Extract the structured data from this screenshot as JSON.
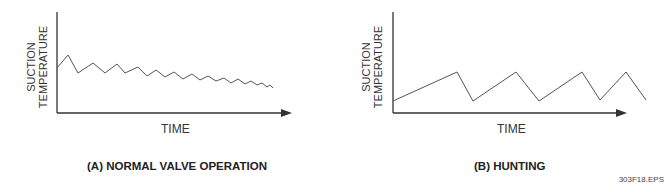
{
  "figure_id": "303F18.EPS",
  "panels": [
    {
      "caption": "(A) NORMAL VALVE OPERATION",
      "ylabel_line1": "SUCTION",
      "ylabel_line2": "TEMPERATURE",
      "xlabel": "TIME",
      "curve_color": "#555555",
      "axis_color": "#333333"
    },
    {
      "caption": "(B) HUNTING",
      "ylabel_line1": "SUCTION",
      "ylabel_line2": "TEMPERATURE",
      "xlabel": "TIME",
      "curve_color": "#555555",
      "axis_color": "#333333"
    }
  ],
  "chart_data": [
    {
      "type": "line",
      "title": "(A) NORMAL VALVE OPERATION",
      "xlabel": "TIME",
      "ylabel": "SUCTION TEMPERATURE",
      "description": "Damped oscillation: suction temperature oscillates with decreasing amplitude and gradually decreasing mean over time",
      "points_px": [
        [
          57,
          68
        ],
        [
          68,
          55
        ],
        [
          78,
          73
        ],
        [
          93,
          63
        ],
        [
          105,
          73
        ],
        [
          117,
          64
        ],
        [
          125,
          73
        ],
        [
          138,
          67
        ],
        [
          147,
          76
        ],
        [
          156,
          70
        ],
        [
          165,
          77
        ],
        [
          174,
          72
        ],
        [
          183,
          79
        ],
        [
          192,
          74
        ],
        [
          200,
          80
        ],
        [
          208,
          76
        ],
        [
          216,
          81
        ],
        [
          224,
          78
        ],
        [
          231,
          83
        ],
        [
          238,
          79
        ],
        [
          245,
          84
        ],
        [
          251,
          81
        ],
        [
          257,
          85
        ],
        [
          262,
          83
        ],
        [
          267,
          87
        ],
        [
          270,
          85
        ],
        [
          273,
          88
        ]
      ]
    },
    {
      "type": "line",
      "title": "(B) HUNTING",
      "xlabel": "TIME",
      "ylabel": "SUCTION TEMPERATURE",
      "description": "Sustained sawtooth oscillation: suction temperature repeatedly rises and drops sharply without settling",
      "points_px": [
        [
          393,
          101
        ],
        [
          457,
          72
        ],
        [
          473,
          101
        ],
        [
          516,
          72
        ],
        [
          539,
          101
        ],
        [
          582,
          72
        ],
        [
          600,
          100
        ],
        [
          626,
          72
        ],
        [
          646,
          100
        ]
      ]
    }
  ]
}
